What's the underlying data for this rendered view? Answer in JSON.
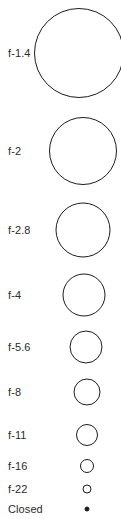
{
  "chart_data": {
    "type": "scatter",
    "xlabel": "",
    "ylabel": "f-stop",
    "grid": false,
    "legend": null,
    "categories": [
      "f-1.4",
      "f-2",
      "f-2.8",
      "f-4",
      "f-5.6",
      "f-8",
      "f-11",
      "f-16",
      "f-22",
      "Closed"
    ],
    "values": [
      90,
      68,
      55,
      43,
      33,
      27,
      22,
      14,
      9,
      5
    ],
    "value_unit": "px diameter of drawn aperture circle",
    "annotations": "Open aperture circles shrink progressively; final 'Closed' state is a small filled dot."
  },
  "chart": {
    "background_color": "#ffffff",
    "stroke_color": "#1c1c1c",
    "text_color": "#2b2b2b",
    "rows": [
      {
        "label": "f-1.4",
        "diameter": 90,
        "center_x": 79,
        "center_y": 53,
        "filled": false
      },
      {
        "label": "f-2",
        "diameter": 68,
        "center_x": 83,
        "center_y": 151,
        "filled": false
      },
      {
        "label": "f-2.8",
        "diameter": 55,
        "center_x": 83,
        "center_y": 230,
        "filled": false
      },
      {
        "label": "f-4",
        "diameter": 43,
        "center_x": 84,
        "center_y": 295,
        "filled": false
      },
      {
        "label": "f-5.6",
        "diameter": 33,
        "center_x": 86,
        "center_y": 347,
        "filled": false
      },
      {
        "label": "f-8",
        "diameter": 27,
        "center_x": 87,
        "center_y": 392,
        "filled": false
      },
      {
        "label": "f-11",
        "diameter": 22,
        "center_x": 87,
        "center_y": 435,
        "filled": false
      },
      {
        "label": "f-16",
        "diameter": 14,
        "center_x": 87,
        "center_y": 466,
        "filled": false
      },
      {
        "label": "f-22",
        "diameter": 9,
        "center_x": 87,
        "center_y": 489,
        "filled": false
      },
      {
        "label": "Closed",
        "diameter": 5,
        "center_x": 87,
        "center_y": 509,
        "filled": true
      }
    ]
  }
}
